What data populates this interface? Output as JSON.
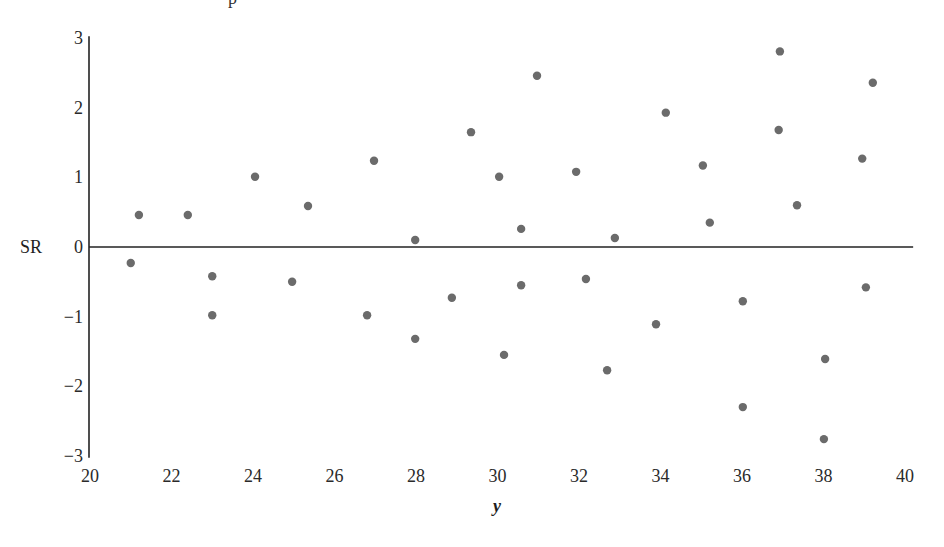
{
  "chart_data": {
    "type": "scatter",
    "title": "",
    "clipped_top_text": "p",
    "xlabel": "y",
    "ylabel": "SR",
    "xlim": [
      20,
      40
    ],
    "ylim": [
      -3,
      3
    ],
    "grid": false,
    "legend": null,
    "reference_line": {
      "y": 0,
      "x_from": 20,
      "x_to": 40.2
    },
    "x_ticks": [
      20,
      22,
      24,
      26,
      28,
      30,
      32,
      34,
      36,
      38,
      40
    ],
    "y_ticks": [
      3,
      2,
      1,
      0,
      -1,
      -2,
      -3
    ],
    "y_tick_labels": [
      "3",
      "2",
      "1",
      "0",
      "−1",
      "−2",
      "−3"
    ],
    "marker_color": "#6b6b6b",
    "points": [
      {
        "x": 21.0,
        "y": -0.23
      },
      {
        "x": 21.2,
        "y": 0.46
      },
      {
        "x": 22.4,
        "y": 0.46
      },
      {
        "x": 23.0,
        "y": -0.42
      },
      {
        "x": 23.0,
        "y": -0.98
      },
      {
        "x": 24.05,
        "y": 1.01
      },
      {
        "x": 24.96,
        "y": -0.5
      },
      {
        "x": 25.35,
        "y": 0.59
      },
      {
        "x": 26.8,
        "y": -0.98
      },
      {
        "x": 26.97,
        "y": 1.24
      },
      {
        "x": 27.98,
        "y": 0.1
      },
      {
        "x": 27.98,
        "y": -1.32
      },
      {
        "x": 28.88,
        "y": -0.73
      },
      {
        "x": 29.35,
        "y": 1.65
      },
      {
        "x": 30.04,
        "y": 1.01
      },
      {
        "x": 30.16,
        "y": -1.55
      },
      {
        "x": 30.58,
        "y": 0.26
      },
      {
        "x": 30.58,
        "y": -0.55
      },
      {
        "x": 30.97,
        "y": 2.46
      },
      {
        "x": 31.93,
        "y": 1.08
      },
      {
        "x": 32.17,
        "y": -0.46
      },
      {
        "x": 32.69,
        "y": -1.77
      },
      {
        "x": 32.88,
        "y": 0.13
      },
      {
        "x": 33.89,
        "y": -1.11
      },
      {
        "x": 34.13,
        "y": 1.93
      },
      {
        "x": 35.04,
        "y": 1.17
      },
      {
        "x": 35.21,
        "y": 0.35
      },
      {
        "x": 36.02,
        "y": -0.78
      },
      {
        "x": 36.02,
        "y": -2.3
      },
      {
        "x": 36.9,
        "y": 1.68
      },
      {
        "x": 36.93,
        "y": 2.81
      },
      {
        "x": 37.35,
        "y": 0.6
      },
      {
        "x": 38.04,
        "y": -1.61
      },
      {
        "x": 38.01,
        "y": -2.76
      },
      {
        "x": 38.95,
        "y": 1.27
      },
      {
        "x": 39.04,
        "y": -0.58
      },
      {
        "x": 39.21,
        "y": 2.36
      }
    ]
  }
}
